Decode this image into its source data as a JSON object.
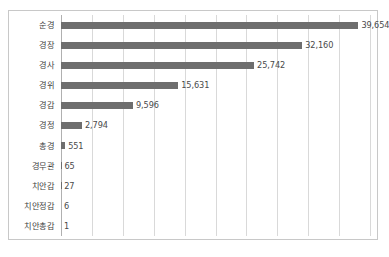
{
  "chart_data": {
    "type": "bar",
    "orientation": "horizontal",
    "title": "",
    "subtitle": "",
    "xlabel": "",
    "ylabel": "",
    "categories": [
      "순경",
      "경장",
      "경사",
      "경위",
      "경감",
      "경정",
      "총경",
      "경무관",
      "치안감",
      "치안정감",
      "치안총감"
    ],
    "values": [
      39654,
      32160,
      25742,
      15631,
      9596,
      2794,
      551,
      65,
      27,
      6,
      1
    ],
    "value_labels": [
      "39,654",
      "32,160",
      "25,742",
      "15,631",
      "9,596",
      "2,794",
      "551",
      "65",
      "27",
      "6",
      "1"
    ],
    "xlim": [
      0,
      41200
    ],
    "gridlines": 10,
    "grid": true,
    "legend": "none",
    "tick_labels": [],
    "series": [
      {
        "name": "인원",
        "values": [
          39654,
          32160,
          25742,
          15631,
          9596,
          2794,
          551,
          65,
          27,
          6,
          1
        ]
      }
    ]
  },
  "colors": {
    "bar": "#6e6e6e",
    "grid": "#d9d9d9",
    "axis": "#b0b0b0",
    "frame": "#c8c8c8",
    "label_text": "#3f3f3f",
    "value_text": "#4a4a4a",
    "background": "#ffffff"
  }
}
